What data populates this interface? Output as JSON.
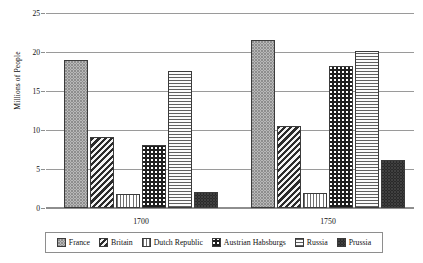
{
  "chart_data": {
    "type": "bar",
    "title": "",
    "subtitle": "",
    "xlabel": "",
    "ylabel": "Millions of People",
    "categories": [
      "1700",
      "1750"
    ],
    "ylim": [
      0,
      25
    ],
    "yticks": [
      0,
      5,
      10,
      15,
      20,
      25
    ],
    "ytick_labels": [
      "0",
      "5",
      "10",
      "15",
      "20",
      "25"
    ],
    "grid": true,
    "legend_position": "bottom",
    "series": [
      {
        "name": "France",
        "values": [
          19.0,
          21.5
        ],
        "pattern": "light-dotted-checker",
        "color": "#e2e2e2"
      },
      {
        "name": "Britain",
        "values": [
          9.1,
          10.5
        ],
        "pattern": "diagonal-stripes",
        "color": "#2b2b2b"
      },
      {
        "name": "Dutch Republic",
        "values": [
          1.8,
          1.9
        ],
        "pattern": "vertical-stripes",
        "color": "#ffffff"
      },
      {
        "name": "Austrian Habsburgs",
        "values": [
          8.1,
          18.2
        ],
        "pattern": "dark-checkerboard",
        "color": "#1f1f1f"
      },
      {
        "name": "Russia",
        "values": [
          17.6,
          20.1
        ],
        "pattern": "horizontal-stripes",
        "color": "#fafafa"
      },
      {
        "name": "Prussia",
        "values": [
          2.1,
          6.2
        ],
        "pattern": "solid-dark-speckle",
        "color": "#171717"
      }
    ]
  },
  "axes": {
    "y_title": "Millions of People",
    "ticks": [
      "25",
      "20",
      "15",
      "10",
      "5",
      "0"
    ]
  },
  "group_labels": [
    "1700",
    "1750"
  ],
  "legend": {
    "entries": [
      {
        "label": "France"
      },
      {
        "label": "Britain"
      },
      {
        "label": "Dutch Republic"
      },
      {
        "label": "Austrian Habsburgs"
      },
      {
        "label": "Russia"
      },
      {
        "label": "Prussia"
      }
    ]
  },
  "style": {
    "grid_color": "#9a9a9a",
    "axis_color": "#8e8e8e",
    "bar_border": "#3b3b3b",
    "text_color": "#111111",
    "background": "#ffffff"
  }
}
